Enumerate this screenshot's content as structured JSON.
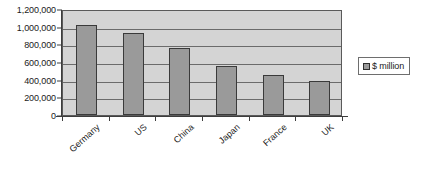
{
  "chart_data": {
    "type": "bar",
    "title": "",
    "subtitle": "",
    "xlabel": "",
    "ylabel": "",
    "categories": [
      "Germany",
      "US",
      "China",
      "Japan",
      "France",
      "UK"
    ],
    "values": [
      1020000,
      930000,
      760000,
      550000,
      450000,
      390000
    ],
    "series": [
      {
        "name": "$ million",
        "values": [
          1020000,
          930000,
          760000,
          550000,
          450000,
          390000
        ],
        "color": "#9a9a9a"
      }
    ],
    "ylim": [
      0,
      1200000
    ],
    "ytick_step": 200000,
    "ytick_labels": [
      "1,200,000",
      "1,000,000",
      "800,000",
      "600,000",
      "400,000",
      "200,000",
      "0"
    ],
    "ytick_values": [
      1200000,
      1000000,
      800000,
      600000,
      400000,
      200000,
      0
    ],
    "grid": true,
    "grid_axis": "y",
    "legend": {
      "position": "right",
      "entries": [
        {
          "label": "$ million",
          "swatch_color": "#9a9a9a"
        }
      ]
    },
    "colors": {
      "plot_background": "#d4d4d4",
      "page_background": "#ffffff",
      "bar_fill": "#9a9a9a",
      "bar_border": "#3a3a3a",
      "gridline": "#6b6b6b",
      "axis_line": "#3d3d3d",
      "plot_border": "#5a5a5a",
      "text": "#1a1a1a",
      "legend_border": "#6e6e6e"
    },
    "xtick_label_rotation": -42
  }
}
